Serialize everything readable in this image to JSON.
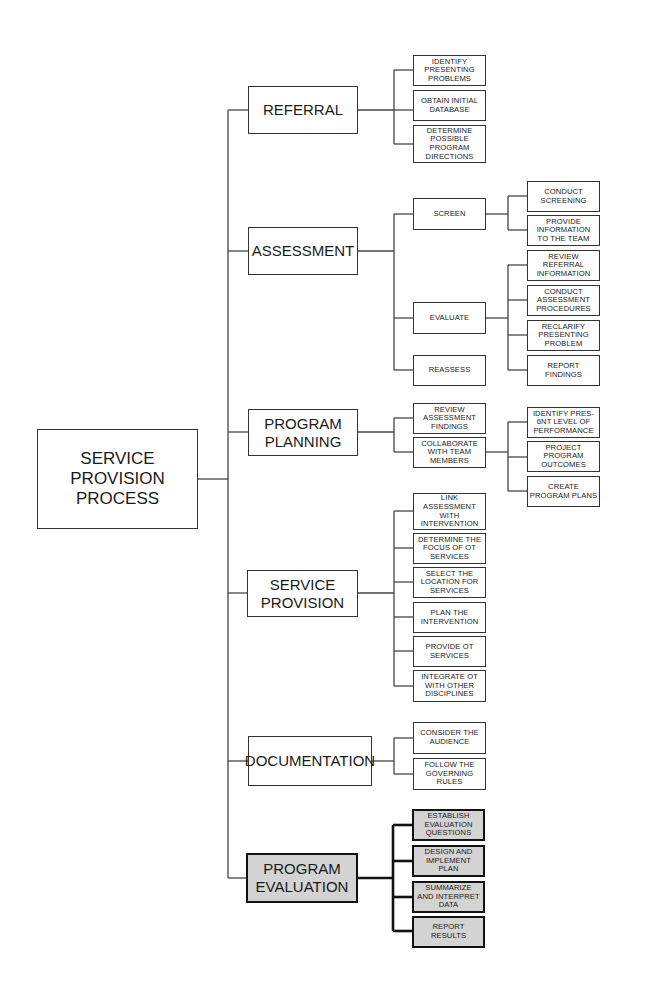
{
  "root": {
    "label": "SERVICE\nPROVISION\nPROCESS"
  },
  "phases": [
    {
      "label": "REFERRAL",
      "children": [
        {
          "label": "IDENTIFY\nPRESENTING\nPROBLEMS"
        },
        {
          "label": "OBTAIN INITIAL\nDATABASE"
        },
        {
          "label": "DETERMINE\nPOSSIBLE\nPROGRAM\nDIRECTIONS"
        }
      ]
    },
    {
      "label": "ASSESSMENT",
      "children": [
        {
          "label": "SCREEN",
          "children": [
            {
              "label": "CONDUCT\nSCREENING"
            },
            {
              "label": "PROVIDE\nINFORMATION\nTO THE TEAM"
            }
          ]
        },
        {
          "label": "EVALUATE",
          "children": [
            {
              "label": "REVIEW\nREFERRAL\nINFORMATION"
            },
            {
              "label": "CONDUCT\nASSESSMENT\nPROCEDURES"
            },
            {
              "label": "RECLARIFY\nPRESENTING\nPROBLEM"
            },
            {
              "label": "REPORT\nFINDINGS"
            }
          ]
        },
        {
          "label": "REASSESS"
        }
      ]
    },
    {
      "label": "PROGRAM\nPLANNING",
      "children": [
        {
          "label": "REVIEW\nASSESSMENT\nFINDINGS"
        },
        {
          "label": "COLLABORATE\nWITH TEAM\nMEMBERS",
          "children": [
            {
              "label": "IDENTIFY  PRES-\n6NT LEVEL OF\nPERFORMANCE"
            },
            {
              "label": "PROJECT\nPROGRAM\nOUTCOMES"
            },
            {
              "label": "CREATE\nPROGRAM PLANS"
            }
          ]
        }
      ]
    },
    {
      "label": "SERVICE\nPROVISION",
      "children": [
        {
          "label": "LINK\nASSESSMENT\nWITH\nINTERVENTION"
        },
        {
          "label": "DETERMINE THE\nFOCUS OF OT\nSERVICES"
        },
        {
          "label": "SELECT THE\nLOCATION FOR\nSERVICES"
        },
        {
          "label": "PLAN THE\nINTERVENTION"
        },
        {
          "label": "PROVIDE OT\nSERVICES"
        },
        {
          "label": "INTEGRATE OT\nWITH OTHER\nDISCIPLINES"
        }
      ]
    },
    {
      "label": "DOCUMENTATION",
      "children": [
        {
          "label": "CONSIDER THE\nAUDIENCE"
        },
        {
          "label": "FOLLOW THE\nGOVERNING\nRULES"
        }
      ]
    },
    {
      "label": "PROGRAM\nEVALUATION",
      "highlighted": true,
      "children": [
        {
          "label": "ESTABLISH\nEVALUATION\nQUESTIONS"
        },
        {
          "label": "DESIGN AND\nIMPLEMENT\nPLAN"
        },
        {
          "label": "SUMMARIZE\nAND INTERPRET\nDATA"
        },
        {
          "label": "REPORT\nRESULTS"
        }
      ]
    }
  ],
  "colors": {
    "highlight_fill": "#d3d3d3",
    "line": "#444444",
    "highlight_line": "#111111"
  }
}
